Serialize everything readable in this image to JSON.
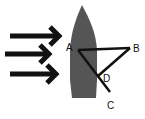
{
  "diagram": {
    "title": "",
    "colors": {
      "boat": "#555555",
      "arrows": "#111111",
      "lines": "#111111",
      "background": "#ffffff"
    },
    "arrows": [
      {
        "name": "current-arrow-top",
        "direction": "right"
      },
      {
        "name": "current-arrow-middle",
        "direction": "right"
      },
      {
        "name": "current-arrow-bottom",
        "direction": "right"
      }
    ],
    "points": {
      "A": {
        "label": "A"
      },
      "B": {
        "label": "B"
      },
      "C": {
        "label": "C"
      },
      "D": {
        "label": "D"
      }
    },
    "segments": [
      {
        "from": "A",
        "to": "B"
      },
      {
        "from": "A",
        "to": "C"
      },
      {
        "from": "B",
        "to": "D"
      }
    ]
  }
}
